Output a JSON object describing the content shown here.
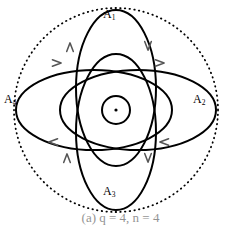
{
  "figure": {
    "caption": "(a)  q = 4,  n = 4",
    "background_color": "#ffffff",
    "stroke_color": "#000000"
  },
  "labels": {
    "top": {
      "base": "A",
      "sub": "1"
    },
    "right": {
      "base": "A",
      "sub": "2"
    },
    "bottom": {
      "base": "A",
      "sub": "3"
    },
    "left": {
      "base": "A",
      "sub": "4"
    }
  },
  "chart_data": {
    "type": "diagram",
    "title": "",
    "center": {
      "x": 116,
      "y": 110
    },
    "outer_circle": {
      "shape": "circle",
      "cx": 116,
      "cy": 110,
      "r": 102,
      "stroke": "#000000",
      "style": "dotted",
      "stroke_width": 1.8,
      "dash": "0.5 4.2"
    },
    "ellipses": [
      {
        "name": "ellipse-vertical-upper",
        "rx": 40,
        "ry": 78,
        "rotation": 0,
        "cx": 116,
        "cy": 88,
        "stroke": "#000000",
        "stroke_width": 2.0
      },
      {
        "name": "ellipse-vertical-lower",
        "rx": 40,
        "ry": 78,
        "rotation": 0,
        "cx": 116,
        "cy": 132,
        "stroke": "#000000",
        "stroke_width": 2.0
      },
      {
        "name": "ellipse-horizontal-left",
        "rx": 78,
        "ry": 40,
        "rotation": 0,
        "cx": 94,
        "cy": 110,
        "stroke": "#000000",
        "stroke_width": 2.0
      },
      {
        "name": "ellipse-horizontal-right",
        "rx": 78,
        "ry": 40,
        "rotation": 0,
        "cx": 138,
        "cy": 110,
        "stroke": "#000000",
        "stroke_width": 2.0
      }
    ],
    "center_circle": {
      "shape": "circle",
      "cx": 116,
      "cy": 110,
      "r": 14,
      "stroke": "#000000",
      "stroke_width": 2.0,
      "fill": "none"
    },
    "center_dot": {
      "shape": "circle",
      "cx": 116,
      "cy": 110,
      "r": 1.6,
      "fill": "#000000"
    },
    "arrows": [
      {
        "name": "arrow-top-horizontal-left",
        "x": 57,
        "y": 63,
        "direction": "right",
        "color": "#555555"
      },
      {
        "name": "arrow-top-horizontal-right",
        "x": 160,
        "y": 63,
        "direction": "right",
        "color": "#555555"
      },
      {
        "name": "arrow-bottom-horizontal-left",
        "x": 53,
        "y": 142,
        "direction": "left",
        "color": "#555555"
      },
      {
        "name": "arrow-bottom-horizontal-right",
        "x": 164,
        "y": 142,
        "direction": "left",
        "color": "#555555"
      },
      {
        "name": "arrow-left-vertical-upper",
        "x": 70,
        "y": 47,
        "direction": "up",
        "color": "#555555"
      },
      {
        "name": "arrow-right-vertical-upper",
        "x": 148,
        "y": 46,
        "direction": "down",
        "color": "#555555"
      },
      {
        "name": "arrow-left-vertical-lower",
        "x": 67,
        "y": 158,
        "direction": "up",
        "color": "#555555"
      },
      {
        "name": "arrow-right-vertical-lower",
        "x": 148,
        "y": 158,
        "direction": "down",
        "color": "#555555"
      }
    ]
  }
}
